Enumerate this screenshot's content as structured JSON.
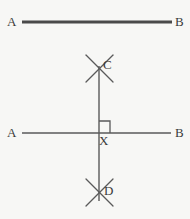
{
  "figure": {
    "background_color": "#f7f7f5",
    "stroke_color": "#5a5a5a",
    "stroke_color_bold": "#4a4a4a",
    "label_color": "#3b3b3b",
    "labels": {
      "a_top": "A",
      "b_top": "B",
      "c": "C",
      "a_bottom": "A",
      "b_bottom": "B",
      "x": "X",
      "d": "D"
    },
    "elements": {
      "top_segment": {
        "name": "segment AB (given line)",
        "x1": 22,
        "y1": 22,
        "x2": 172,
        "y2": 22,
        "thickness": 3
      },
      "bottom_segment": {
        "name": "line AB through X",
        "x1": 22,
        "y1": 133,
        "x2": 171,
        "y2": 133,
        "thickness": 1.4
      },
      "vertical_line": {
        "name": "perpendicular line CD through X",
        "x1": 99,
        "y1": 66,
        "x2": 99,
        "y2": 201,
        "thickness": 1.4
      },
      "right_angle_marker": {
        "name": "right angle square at X",
        "x": 99,
        "y": 121,
        "size": 11
      },
      "arc_pair_c": {
        "name": "compass arc intersection at C",
        "crossing_x": 99,
        "crossing_y": 67,
        "stroke1": {
          "x1": 86,
          "y1": 55,
          "x2": 113,
          "y2": 82
        },
        "stroke2": {
          "x1": 113,
          "y1": 55,
          "x2": 86,
          "y2": 82
        }
      },
      "arc_pair_d": {
        "name": "compass arc intersection at D",
        "crossing_x": 99,
        "crossing_y": 192,
        "stroke1": {
          "x1": 86,
          "y1": 179,
          "x2": 113,
          "y2": 206
        },
        "stroke2": {
          "x1": 113,
          "y1": 179,
          "x2": 86,
          "y2": 206
        }
      }
    }
  }
}
